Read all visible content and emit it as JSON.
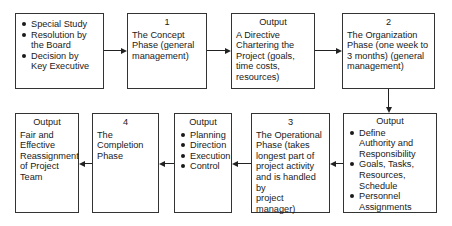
{
  "top_row": {
    "initiation": {
      "items": [
        "Special Study",
        "Resolution by\nthe Board",
        "Decision by\nKey Executive"
      ]
    },
    "phase1": {
      "number": "1",
      "text": "The Concept\nPhase (general\nmanagement)"
    },
    "output1": {
      "header": "Output",
      "text": "A Directive\nChartering the\nProject (goals,\ntime costs,\nresources)"
    },
    "phase2": {
      "number": "2",
      "text": "The Organization\nPhase (one week to\n3 months) (general\nmanagement)"
    }
  },
  "bottom_row": {
    "output2": {
      "header": "Output",
      "items": [
        "Define\nAuthority and\nResponsibility",
        "Goals, Tasks,\nResources,\nSchedule",
        "Personnel\nAssignments"
      ]
    },
    "phase3": {
      "number": "3",
      "text": "The Operational\nPhase (takes\nlongest part of\nproject activity\nand is handled by\nproject manager)"
    },
    "output3": {
      "header": "Output",
      "items": [
        "Planning",
        "Direction",
        "Execution",
        "Control"
      ]
    },
    "phase4": {
      "number": "4",
      "text": "The\nCompletion\nPhase"
    },
    "output4": {
      "header": "Output",
      "text": "Fair and\nEffective\nReassignment\nof Project\nTeam"
    }
  }
}
